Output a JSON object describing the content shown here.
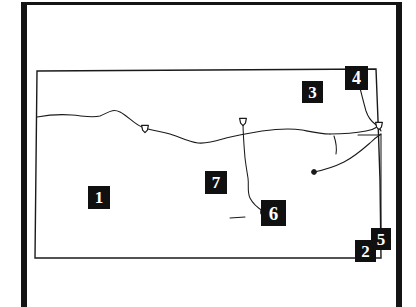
{
  "figure": {
    "kind": "line-map",
    "region_name": "Kansas",
    "background_color": "#ffffff",
    "ink_color": "#1a1a1a",
    "frame_color": "#141414",
    "callout_box_color": "#101010",
    "callout_text_color": "#ffffff"
  },
  "callouts": [
    {
      "id": "1",
      "label": "1",
      "x": 88,
      "y": 186
    },
    {
      "id": "2",
      "label": "2",
      "x": 355,
      "y": 240
    },
    {
      "id": "3",
      "label": "3",
      "x": 302,
      "y": 81
    },
    {
      "id": "4",
      "label": "4",
      "x": 345,
      "y": 66
    },
    {
      "id": "5",
      "label": "5",
      "x": 371,
      "y": 228
    },
    {
      "id": "6",
      "label": "6",
      "x": 261,
      "y": 200
    },
    {
      "id": "7",
      "label": "7",
      "x": 205,
      "y": 171
    }
  ],
  "map_geometry": {
    "state_outline": "M 37,71 L 376,69 L 378,120 L 380,180 L 381,258 L 35,258 Z",
    "rivers": [
      {
        "name": "main-east-west-river",
        "path": "M 37,117 C 48,115 60,114 72,115 C 84,116 92,118 100,116 C 108,113 112,108 120,112 C 128,116 134,124 142,127 C 152,131 160,131 170,134 C 180,137 188,142 198,143 C 208,144 216,141 226,138 C 238,135 250,133 262,131 C 276,129 290,128 302,130 C 312,132 320,134 330,134"
      },
      {
        "name": "north-branch-to-confluence",
        "path": "M 330,134 C 344,134 356,133 366,131 C 372,130 376,128 379,126"
      },
      {
        "name": "northeast-river-from-border",
        "path": "M 360,88 C 362,96 364,104 366,111 C 368,117 371,121 375,124 C 378,126 380,128 381,131"
      },
      {
        "name": "central-north-south-river",
        "path": "M 243,122 C 243,134 244,146 245,158 C 246,166 247,172 248,178 C 249,186 247,192 250,198 C 253,204 258,208 263,211"
      },
      {
        "name": "southeast-tributary",
        "path": "M 314,172 C 324,170 334,167 344,162 C 354,157 362,150 370,143 C 374,139 378,136 381,134"
      },
      {
        "name": "east-border-river",
        "path": "M 381,134 C 381,150 381,170 381,190 C 381,210 381,230 381,248"
      },
      {
        "name": "short-east-stub",
        "path": "M 334,136 C 336,142 337,148 336,154"
      },
      {
        "name": "west-short-dash",
        "path": "M 230,218 L 245,217"
      },
      {
        "name": "east-horizontal-tick",
        "path": "M 358,135 L 380,135"
      }
    ],
    "city_markers": [
      {
        "name": "city-marker-west",
        "x": 145,
        "y": 129,
        "shape": "shield"
      },
      {
        "name": "city-marker-central",
        "x": 243,
        "y": 122,
        "shape": "shield"
      },
      {
        "name": "city-marker-east",
        "x": 314,
        "y": 172,
        "shape": "dot"
      },
      {
        "name": "city-marker-south",
        "x": 264,
        "y": 212,
        "shape": "ring"
      },
      {
        "name": "city-marker-border",
        "x": 379,
        "y": 126,
        "shape": "shield"
      }
    ]
  }
}
